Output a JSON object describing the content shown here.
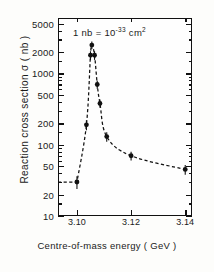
{
  "chart_data": {
    "type": "scatter",
    "title": "",
    "xlabel": "Centre-of-mass energy ( GeV )",
    "ylabel": "Reaction cross section σ ( nb )",
    "annotation": "1 nb = 10⁻³³ cm²",
    "annotation_parts": {
      "lead": "1 nb = 10",
      "exponent": "-33",
      "unit": "cm",
      "unit_exponent": "2"
    },
    "yscale": "log",
    "ylim": [
      10,
      6000
    ],
    "xlim": [
      3.093,
      3.1425
    ],
    "grid": false,
    "legend": null,
    "ytick_labels": [
      "5000",
      "2000",
      "1000",
      "500",
      "200",
      "100",
      "50",
      "20",
      "10"
    ],
    "ytick_values": [
      5000,
      2000,
      1000,
      500,
      200,
      100,
      50,
      20,
      10
    ],
    "yminor_values": [
      4000,
      3000,
      1500,
      900,
      800,
      700,
      600,
      400,
      300,
      150,
      90,
      80,
      70,
      60,
      40,
      30,
      15
    ],
    "xtick_labels": [
      "3.10",
      "3.12",
      "3.14"
    ],
    "xtick_values": [
      3.1,
      3.12,
      3.14
    ],
    "series": [
      {
        "name": "e+e- → hadrons cross section",
        "style": "points-with-dashed-curve",
        "x": [
          3.1,
          3.1035,
          3.105,
          3.1055,
          3.1065,
          3.1075,
          3.1085,
          3.111,
          3.12,
          3.14
        ],
        "y": [
          30,
          190,
          1800,
          2500,
          1800,
          700,
          380,
          130,
          70,
          45
        ],
        "yerr": [
          6,
          30,
          250,
          300,
          250,
          90,
          50,
          20,
          10,
          7
        ]
      }
    ]
  },
  "figure": {
    "background_color": "#fdfdfb",
    "ink_color": "#111111",
    "curve_style": "dashed"
  }
}
